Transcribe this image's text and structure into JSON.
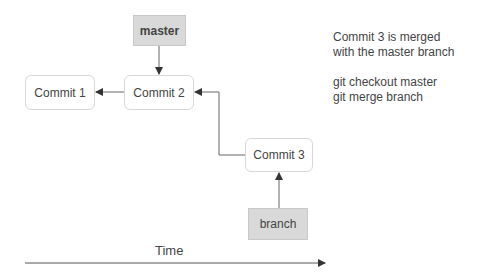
{
  "diagram": {
    "refs": {
      "master": "master",
      "branch": "branch"
    },
    "commits": [
      "Commit 1",
      "Commit 2",
      "Commit 3"
    ],
    "note": {
      "line1": "Commit 3 is merged",
      "line2": "with the master branch",
      "cmd1": "git checkout master",
      "cmd2": "git merge branch"
    },
    "axis": {
      "label": "Time"
    },
    "colors": {
      "ref_fill": "#d9d9d9",
      "commit_border": "#d8d8d8",
      "line": "#555555"
    }
  }
}
